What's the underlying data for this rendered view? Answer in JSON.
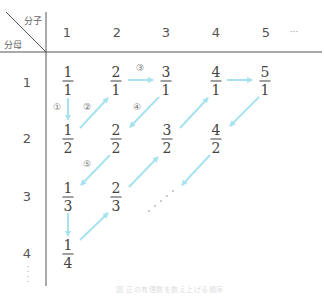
{
  "header": {
    "numerator_label": "分子",
    "denominator_label": "分母",
    "columns": [
      "1",
      "2",
      "3",
      "4",
      "5"
    ],
    "columns_ellipsis": "···",
    "rows": [
      "1",
      "2",
      "3",
      "4"
    ],
    "rows_ellipsis": "⋮"
  },
  "fractions": [
    {
      "num": "1",
      "den": "1"
    },
    {
      "num": "2",
      "den": "1"
    },
    {
      "num": "3",
      "den": "1"
    },
    {
      "num": "4",
      "den": "1"
    },
    {
      "num": "5",
      "den": "1"
    },
    {
      "num": "1",
      "den": "2"
    },
    {
      "num": "2",
      "den": "2"
    },
    {
      "num": "3",
      "den": "2"
    },
    {
      "num": "4",
      "den": "2"
    },
    {
      "num": "1",
      "den": "3"
    },
    {
      "num": "2",
      "den": "3"
    },
    {
      "num": "1",
      "den": "4"
    }
  ],
  "steps": [
    "①",
    "②",
    "③",
    "④",
    "⑤"
  ],
  "diagonal_ellipsis": "· · · · ·",
  "colors": {
    "arrow": "#a6e3ee",
    "grid_line": "#555555",
    "text": "#444444"
  },
  "caption": "図 正の有理数を数え上げる順序"
}
